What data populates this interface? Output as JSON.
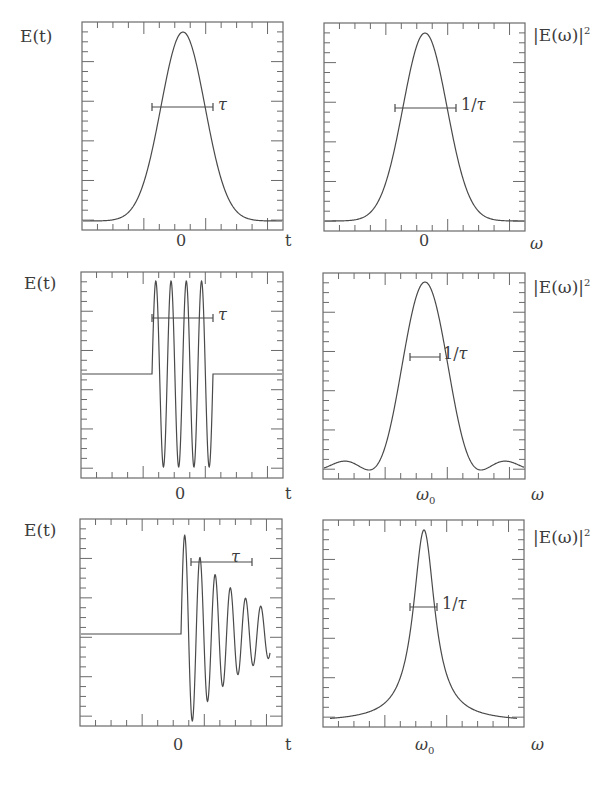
{
  "chart_data": [
    {
      "id": "gaussian-time",
      "type": "line",
      "title": "",
      "ylabel": "E(t)",
      "xlabel": "t",
      "x_tick_labels": [
        "0"
      ],
      "annotation": "τ",
      "description": "Gaussian pulse envelope in time, FWHM bar labeled tau",
      "frame": {
        "x": 82,
        "y": 22,
        "w": 201,
        "h": 208
      },
      "curve_kind": "gaussian",
      "params": {
        "center": 183,
        "peak_y": 32,
        "base_y": 221,
        "sigma": 22
      },
      "bar": {
        "x1": 152,
        "x2": 213,
        "y": 107
      },
      "ylim": [
        0,
        1
      ],
      "grid": false
    },
    {
      "id": "gaussian-freq",
      "type": "line",
      "ylabel": "|E(ω)|²",
      "xlabel": "ω",
      "x_tick_labels": [
        "0"
      ],
      "annotation": "1/τ",
      "description": "Gaussian power spectrum centered at 0, FWHM bar labeled 1/tau",
      "frame": {
        "x": 324,
        "y": 23,
        "w": 201,
        "h": 208
      },
      "curve_kind": "gaussian",
      "params": {
        "center": 425,
        "peak_y": 33,
        "base_y": 221,
        "sigma": 22
      },
      "bar": {
        "x1": 395,
        "x2": 456,
        "y": 108
      },
      "ylim": [
        0,
        1
      ],
      "grid": false
    },
    {
      "id": "square-wavepacket-time",
      "type": "line",
      "ylabel": "E(t)",
      "xlabel": "t",
      "x_tick_labels": [
        "0"
      ],
      "annotation": "τ",
      "description": "Four-cycle sinusoid inside a rectangular window of width tau",
      "frame": {
        "x": 81,
        "y": 272,
        "w": 202,
        "h": 206
      },
      "curve_kind": "rect_sine",
      "params": {
        "start": 152,
        "end": 213,
        "base_y": 374,
        "amp": 93,
        "cycles": 4
      },
      "bar": {
        "x1": 152,
        "x2": 213,
        "y": 318
      },
      "ylim": [
        -1,
        1
      ],
      "grid": false
    },
    {
      "id": "sinc-spectrum",
      "type": "line",
      "ylabel": "|E(ω)|²",
      "xlabel": "ω",
      "x_tick_labels": [
        "ω0"
      ],
      "annotation": "1/τ",
      "description": "sinc-squared spectrum centered at omega_0 with side lobes",
      "frame": {
        "x": 323,
        "y": 273,
        "w": 202,
        "h": 206
      },
      "curve_kind": "sinc2",
      "params": {
        "center": 425,
        "peak_y": 282,
        "base_y": 470,
        "zero_spacing": 56
      },
      "bar": {
        "x1": 410,
        "x2": 440,
        "y": 357
      },
      "ylim": [
        0,
        1
      ],
      "grid": false
    },
    {
      "id": "damped-oscillation-time",
      "type": "line",
      "ylabel": "E(t)",
      "xlabel": "t",
      "x_tick_labels": [
        "0"
      ],
      "annotation": "τ",
      "description": "Exponentially damped oscillation starting at t=0, decay time tau",
      "frame": {
        "x": 80,
        "y": 519,
        "w": 202,
        "h": 207
      },
      "curve_kind": "damped",
      "params": {
        "start": 181,
        "end": 270,
        "base_y": 634,
        "amp": 105,
        "period": 15.2,
        "decay": 60
      },
      "bar": {
        "x1": 191,
        "x2": 252,
        "y": 562
      },
      "ylim": [
        -1,
        1
      ],
      "grid": false
    },
    {
      "id": "lorentzian-spectrum",
      "type": "line",
      "ylabel": "|E(ω)|²",
      "xlabel": "ω",
      "x_tick_labels": [
        "ω0"
      ],
      "annotation": "1/τ",
      "description": "Lorentzian power spectrum centered at omega_0",
      "frame": {
        "x": 323,
        "y": 520,
        "w": 201,
        "h": 207
      },
      "curve_kind": "lorentzian",
      "params": {
        "center": 424,
        "peak_y": 530,
        "base_y": 722,
        "hwhm": 13
      },
      "bar": {
        "x1": 410,
        "x2": 437,
        "y": 607
      },
      "ylim": [
        0,
        1
      ],
      "grid": false
    }
  ],
  "labels": {
    "row1": {
      "ylabel_left": "E(t)",
      "ylabel_right": "|E(ω)|",
      "ylabel_right_sup": "2",
      "tick_left": "0",
      "xlab_left": "t",
      "tick_right": "0",
      "xlab_right": "ω",
      "ann_left": "τ",
      "ann_right_num": "1/",
      "ann_right_sym": "τ"
    },
    "row2": {
      "ylabel_left": "E(t)",
      "ylabel_right": "|E(ω)|",
      "ylabel_right_sup": "2",
      "tick_left": "0",
      "xlab_left": "t",
      "tick_right_main": "ω",
      "tick_right_sub": "0",
      "xlab_right": "ω",
      "ann_left": "τ",
      "ann_right_num": "1/",
      "ann_right_sym": "τ"
    },
    "row3": {
      "ylabel_left": "E(t)",
      "ylabel_right": "|E(ω)|",
      "ylabel_right_sup": "2",
      "tick_left": "0",
      "xlab_left": "t",
      "tick_right_main": "ω",
      "tick_right_sub": "0",
      "xlab_right": "ω",
      "ann_left": "τ",
      "ann_right_num": "1/",
      "ann_right_sym": "τ"
    }
  },
  "colors": {
    "line": "#4a4a4a",
    "frame": "#6a6a6a",
    "text": "#3c3c3c",
    "background": "#ffffff"
  }
}
